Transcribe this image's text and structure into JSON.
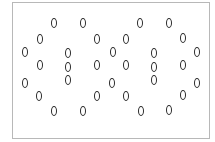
{
  "figure": {
    "stroke_color": "#2a2a2a",
    "frame_color": "#b8b8b8",
    "ellipses": [
      {
        "x": 25,
        "y": 52
      },
      {
        "x": 40,
        "y": 39
      },
      {
        "x": 54,
        "y": 23
      },
      {
        "x": 83,
        "y": 23
      },
      {
        "x": 97,
        "y": 39
      },
      {
        "x": 113,
        "y": 52
      },
      {
        "x": 126,
        "y": 39
      },
      {
        "x": 140,
        "y": 23
      },
      {
        "x": 169,
        "y": 23
      },
      {
        "x": 183,
        "y": 38
      },
      {
        "x": 197,
        "y": 52
      },
      {
        "x": 68,
        "y": 53
      },
      {
        "x": 68,
        "y": 67
      },
      {
        "x": 68,
        "y": 80
      },
      {
        "x": 154,
        "y": 53
      },
      {
        "x": 154,
        "y": 67
      },
      {
        "x": 154,
        "y": 80
      },
      {
        "x": 40,
        "y": 65
      },
      {
        "x": 97,
        "y": 65
      },
      {
        "x": 126,
        "y": 65
      },
      {
        "x": 183,
        "y": 65
      },
      {
        "x": 25,
        "y": 83
      },
      {
        "x": 112,
        "y": 83
      },
      {
        "x": 197,
        "y": 83
      },
      {
        "x": 39,
        "y": 96
      },
      {
        "x": 97,
        "y": 96
      },
      {
        "x": 126,
        "y": 96
      },
      {
        "x": 183,
        "y": 95
      },
      {
        "x": 54,
        "y": 111
      },
      {
        "x": 83,
        "y": 111
      },
      {
        "x": 141,
        "y": 111
      },
      {
        "x": 169,
        "y": 110
      }
    ]
  }
}
